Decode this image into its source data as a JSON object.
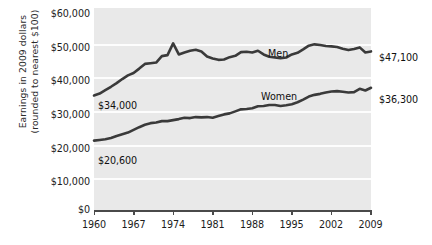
{
  "chart_data": {
    "type": "line",
    "title": "",
    "xlabel": "",
    "ylabel": "Earnings in 2009 dollars (rounded to nearest $100)",
    "ylabel_lines": [
      "Earnings in 2009 dollars",
      "(rounded to nearest $100)"
    ],
    "ylim": [
      0,
      60000
    ],
    "xlim": [
      1960,
      2009
    ],
    "grid": true,
    "legend_position": "inline-labels",
    "ytick_labels": [
      "$60,000",
      "$50,000",
      "$40,000",
      "$30,000",
      "$20,000",
      "$10,000",
      "$0"
    ],
    "ytick_values": [
      60000,
      50000,
      40000,
      30000,
      20000,
      10000,
      0
    ],
    "xtick_labels": [
      "1960",
      "1967",
      "1974",
      "1981",
      "1988",
      "1995",
      "2002",
      "2009"
    ],
    "xtick_values": [
      1960,
      1967,
      1974,
      1981,
      1988,
      1995,
      2002,
      2009
    ],
    "annotations": [
      {
        "name": "men-start-value",
        "text": "$34,000",
        "series": "Men",
        "x": 1960,
        "y": 34000
      },
      {
        "name": "women-start-value",
        "text": "$20,600",
        "series": "Women",
        "x": 1960,
        "y": 20600
      },
      {
        "name": "men-end-value",
        "text": "$47,100",
        "series": "Men",
        "x": 2009,
        "y": 47100
      },
      {
        "name": "women-end-value",
        "text": "$36,300",
        "series": "Women",
        "x": 2009,
        "y": 36300
      }
    ],
    "series": [
      {
        "name": "Men",
        "label": "Men",
        "color": "#3a3a3a",
        "x": [
          1960,
          1961,
          1962,
          1963,
          1964,
          1965,
          1966,
          1967,
          1968,
          1969,
          1970,
          1971,
          1972,
          1973,
          1974,
          1975,
          1976,
          1977,
          1978,
          1979,
          1980,
          1981,
          1982,
          1983,
          1984,
          1985,
          1986,
          1987,
          1988,
          1989,
          1990,
          1991,
          1992,
          1993,
          1994,
          1995,
          1996,
          1997,
          1998,
          1999,
          2000,
          2001,
          2002,
          2003,
          2004,
          2005,
          2006,
          2007,
          2008,
          2009
        ],
        "values": [
          34000,
          34600,
          35600,
          36600,
          37700,
          38900,
          40000,
          40700,
          42000,
          43400,
          43600,
          43800,
          45700,
          46000,
          49500,
          46200,
          46800,
          47300,
          47600,
          47100,
          45600,
          45000,
          44600,
          44700,
          45400,
          45800,
          46900,
          47000,
          46800,
          47300,
          46200,
          45500,
          45300,
          45100,
          45300,
          46200,
          46700,
          47700,
          48800,
          49200,
          49000,
          48700,
          48600,
          48400,
          47900,
          47500,
          47800,
          48300,
          46800,
          47100
        ]
      },
      {
        "name": "Women",
        "label": "Women",
        "color": "#3a3a3a",
        "x": [
          1960,
          1961,
          1962,
          1963,
          1964,
          1965,
          1966,
          1967,
          1968,
          1969,
          1970,
          1971,
          1972,
          1973,
          1974,
          1975,
          1976,
          1977,
          1978,
          1979,
          1980,
          1981,
          1982,
          1983,
          1984,
          1985,
          1986,
          1987,
          1988,
          1989,
          1990,
          1991,
          1992,
          1993,
          1994,
          1995,
          1996,
          1997,
          1998,
          1999,
          2000,
          2001,
          2002,
          2003,
          2004,
          2005,
          2006,
          2007,
          2008,
          2009
        ],
        "values": [
          20600,
          20800,
          21000,
          21400,
          22000,
          22500,
          23000,
          23800,
          24600,
          25300,
          25800,
          26000,
          26400,
          26400,
          26700,
          27000,
          27400,
          27300,
          27600,
          27500,
          27600,
          27400,
          27900,
          28400,
          28700,
          29300,
          29900,
          30000,
          30200,
          30800,
          30900,
          31200,
          31200,
          30900,
          31100,
          31400,
          32000,
          32800,
          33700,
          34200,
          34500,
          34900,
          35200,
          35300,
          35100,
          34900,
          35000,
          36000,
          35500,
          36300
        ]
      }
    ]
  }
}
